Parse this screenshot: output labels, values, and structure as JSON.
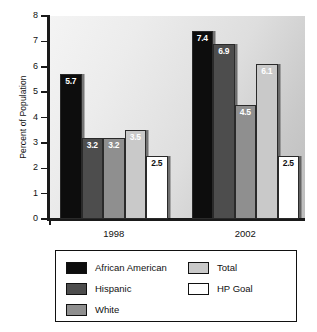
{
  "chart_data": {
    "type": "bar",
    "title": "",
    "xlabel": "",
    "ylabel": "Percent of Population",
    "ylim": [
      0,
      8
    ],
    "ytick_labels": [
      "8",
      "7",
      "6",
      "5",
      "4",
      "3",
      "2",
      "1",
      "0"
    ],
    "grid": false,
    "legend_position": "bottom",
    "categories": [
      "1998",
      "2002"
    ],
    "series": [
      {
        "name": "African American",
        "color": "#0d0d0d",
        "label_color": "#ffffff",
        "values": [
          5.7,
          7.4
        ]
      },
      {
        "name": "Hispanic",
        "color": "#4d4d4d",
        "label_color": "#ffffff",
        "values": [
          3.2,
          6.9
        ]
      },
      {
        "name": "White",
        "color": "#8f8f8f",
        "label_color": "#ffffff",
        "values": [
          3.2,
          4.5
        ]
      },
      {
        "name": "Total",
        "color": "#c9c9c9",
        "label_color": "#ffffff",
        "values": [
          3.5,
          6.1
        ]
      },
      {
        "name": "HP Goal",
        "color": "#ffffff",
        "label_color": "#111111",
        "values": [
          2.5,
          2.5
        ]
      }
    ]
  },
  "legend": {
    "left_column": [
      {
        "name": "African American",
        "color": "#0d0d0d"
      },
      {
        "name": "Hispanic",
        "color": "#4d4d4d"
      },
      {
        "name": "White",
        "color": "#8f8f8f"
      }
    ],
    "right_column": [
      {
        "name": "Total",
        "color": "#c9c9c9"
      },
      {
        "name": "HP Goal",
        "color": "#ffffff"
      }
    ]
  }
}
